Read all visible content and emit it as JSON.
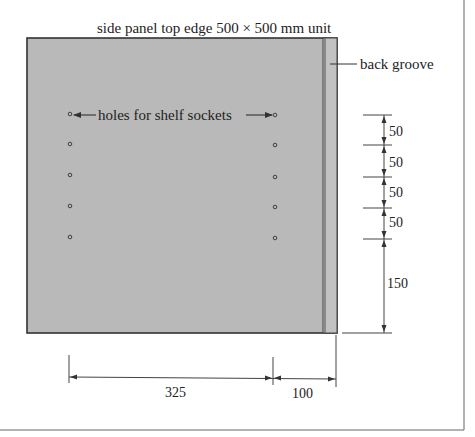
{
  "title": "side panel top edge 500 × 500 mm unit",
  "labels": {
    "back_groove": "back groove",
    "holes": "holes for shelf sockets"
  },
  "vertical_dimensions": [
    "50",
    "50",
    "50",
    "50",
    "150"
  ],
  "horizontal_dimensions": [
    "325",
    "100"
  ],
  "colors": {
    "panel_fill": "#b9b9b9",
    "outline": "#333333",
    "dimension_line": "#444444"
  }
}
